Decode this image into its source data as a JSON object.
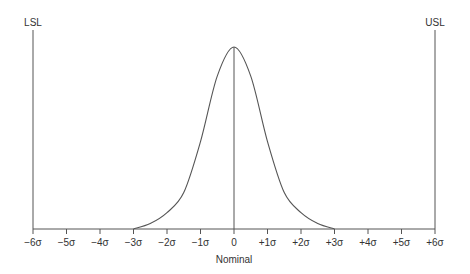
{
  "chart_data": {
    "type": "line",
    "title": "",
    "xlabel": "Nominal",
    "ylabel": "",
    "xlim": [
      -6,
      6
    ],
    "ylim": [
      0,
      1
    ],
    "grid": false,
    "x_ticks": [
      -6,
      -5,
      -4,
      -3,
      -2,
      -1,
      0,
      1,
      2,
      3,
      4,
      5,
      6
    ],
    "x_tick_labels": [
      "-6σ",
      "-5σ",
      "-4σ",
      "-3σ",
      "-2σ",
      "-1σ",
      "0",
      "+1σ",
      "+2σ",
      "+3σ",
      "+4σ",
      "+5σ",
      "+6σ"
    ],
    "series": [
      {
        "name": "distribution",
        "description": "bell-shaped distribution centered at nominal, tails reaching baseline at ±3σ",
        "x": [
          -3,
          -2.5,
          -2,
          -1.5,
          -1,
          -0.5,
          0,
          0.5,
          1,
          1.5,
          2,
          2.5,
          3
        ],
        "values": [
          0.0,
          0.03,
          0.09,
          0.2,
          0.48,
          0.84,
          1.0,
          0.84,
          0.48,
          0.2,
          0.09,
          0.03,
          0.0
        ]
      }
    ],
    "annotations": [
      {
        "text": "LSL",
        "x": -6,
        "type": "vertical-line"
      },
      {
        "text": "USL",
        "x": 6,
        "type": "vertical-line"
      },
      {
        "text": "",
        "x": 0,
        "type": "center-line"
      }
    ],
    "colors": {
      "line": "#555555",
      "text": "#333333"
    }
  }
}
